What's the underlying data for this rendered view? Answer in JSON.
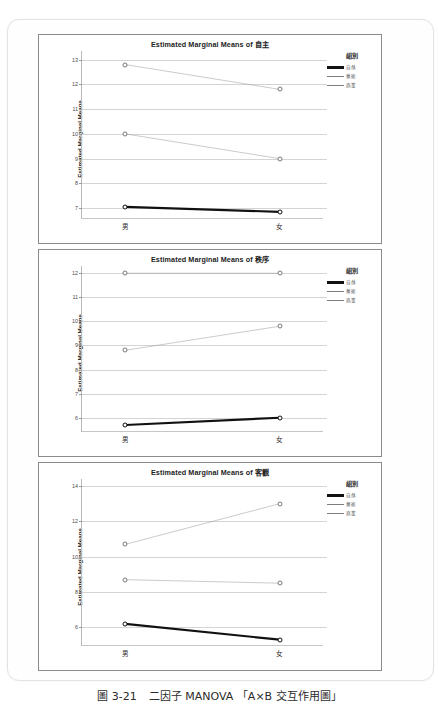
{
  "caption": {
    "figure_number": "圖 3-21",
    "text": "二因子 MANOVA 「A×B 交互作用圖」"
  },
  "legend": {
    "title": "組別",
    "items": [
      {
        "label": "自然",
        "style": "bold"
      },
      {
        "label": "藝術",
        "style": "thin"
      },
      {
        "label": "商業",
        "style": "thin"
      }
    ]
  },
  "axis": {
    "ylabel": "Estimated Marginal Means",
    "categories": [
      "男",
      "女"
    ]
  },
  "chart_data": [
    {
      "type": "line",
      "title": "Estimated Marginal Means of 自主",
      "xlabel": "",
      "ylabel": "Estimated Marginal Means",
      "categories": [
        "男",
        "女"
      ],
      "yticks": [
        13,
        12,
        11,
        10,
        9,
        8,
        7
      ],
      "ylim": [
        6.6,
        13.35
      ],
      "grid": true,
      "legend_position": "right",
      "series": [
        {
          "name": "自然",
          "style": "bold",
          "values": [
            7.05,
            6.85
          ]
        },
        {
          "name": "藝術",
          "style": "thin",
          "values": [
            10.0,
            9.0
          ]
        },
        {
          "name": "商業",
          "style": "thin",
          "values": [
            12.8,
            11.8
          ]
        }
      ]
    },
    {
      "type": "line",
      "title": "Estimated Marginal Means of 秩序",
      "xlabel": "",
      "ylabel": "Estimated Marginal Means",
      "categories": [
        "男",
        "女"
      ],
      "yticks": [
        12,
        11,
        10,
        9,
        8,
        7,
        6
      ],
      "ylim": [
        5.45,
        12.3
      ],
      "grid": true,
      "legend_position": "right",
      "series": [
        {
          "name": "自然",
          "style": "bold",
          "values": [
            5.7,
            6.0
          ]
        },
        {
          "name": "藝術",
          "style": "thin",
          "values": [
            8.8,
            9.8
          ]
        },
        {
          "name": "商業",
          "style": "thin",
          "values": [
            12.0,
            12.0
          ]
        }
      ]
    },
    {
      "type": "line",
      "title": "Estimated Marginal Means of 客觀",
      "xlabel": "",
      "ylabel": "Estimated Marginal Means",
      "categories": [
        "男",
        "女"
      ],
      "yticks": [
        14,
        12,
        10,
        8,
        6
      ],
      "ylim": [
        5.0,
        14.4
      ],
      "grid": true,
      "legend_position": "right",
      "series": [
        {
          "name": "自然",
          "style": "bold",
          "values": [
            6.2,
            5.3
          ]
        },
        {
          "name": "藝術",
          "style": "thin",
          "values": [
            8.7,
            8.5
          ]
        },
        {
          "name": "商業",
          "style": "thin",
          "values": [
            10.7,
            13.0
          ]
        }
      ]
    }
  ]
}
